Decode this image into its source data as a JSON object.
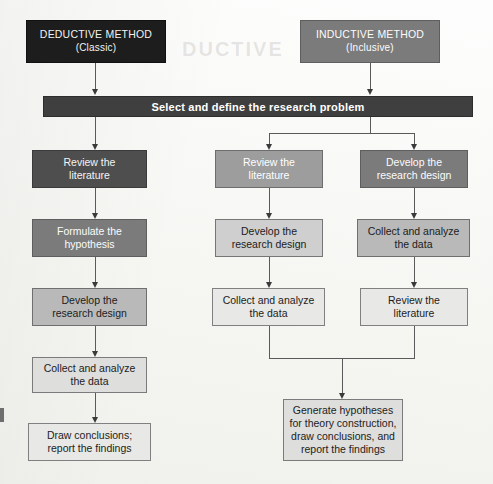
{
  "diagram": {
    "title_deductive": "DEDUCTIVE METHOD",
    "subtitle_deductive": "(Classic)",
    "title_inductive": "INDUCTIVE METHOD",
    "subtitle_inductive": "(Inclusive)",
    "shared_step": "Select and define the research problem",
    "ghost_text": "DUCTIVE",
    "deductive_steps": [
      "Review the\nliterature",
      "Formulate the\nhypothesis",
      "Develop the\nresearch design",
      "Collect and analyze\nthe data",
      "Draw conclusions;\nreport the findings"
    ],
    "inductive_middle_steps": [
      "Review the\nliterature",
      "Develop the\nresearch design",
      "Collect and analyze\nthe data"
    ],
    "inductive_right_steps": [
      "Develop the\nresearch design",
      "Collect and analyze\nthe data",
      "Review the\nliterature"
    ],
    "final_step": "Generate hypotheses\nfor theory construction,\ndraw conclusions, and\nreport the findings",
    "colors": {
      "background": "#f7f7f5",
      "black": "#1d1d1d",
      "dark": "#4e4e4e",
      "mid": "#7b7b7b",
      "midlight": "#9d9d9d",
      "light": "#b9b9b9",
      "lighter": "#cfcfcf",
      "pale": "#dededc",
      "palest": "#e8e8e6",
      "bar": "#3f3f3f",
      "connector": "#5a5a5a"
    }
  }
}
